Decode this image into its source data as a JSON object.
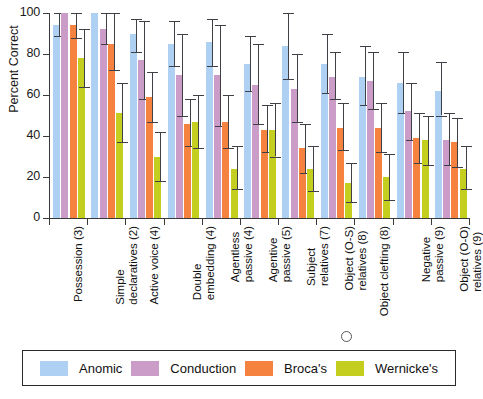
{
  "chart_data": {
    "type": "bar",
    "title": "",
    "xlabel": "",
    "ylabel": "Percent Correct",
    "ylim": [
      0,
      100
    ],
    "yticks": [
      0,
      20,
      40,
      60,
      80,
      100
    ],
    "grid": false,
    "legend_position": "bottom",
    "error_bars": "vertical-range",
    "categories": [
      "Possession (3)",
      "Simple declaratives (2)",
      "Active voice (4)",
      "Double embedding (4)",
      "Agentless passive (4)",
      "Agentive passive (5)",
      "Subject relatives (7)",
      "Object (O-S) relatives (8)",
      "Object clefting (8)",
      "Negative passive (9)",
      "Object (O-O) relatives (9)"
    ],
    "categories_lines": [
      [
        "Possession (3)"
      ],
      [
        "Simple",
        "declaratives (2)"
      ],
      [
        "Active voice (4)"
      ],
      [
        "Double",
        "embedding (4)"
      ],
      [
        "Agentless",
        "passive (4)"
      ],
      [
        "Agentive",
        "passive (5)"
      ],
      [
        "Subject",
        "relatives (7)"
      ],
      [
        "Object (O-S)",
        "relatives (8)"
      ],
      [
        "Object clefting (8)"
      ],
      [
        "Negative",
        "passive (9)"
      ],
      [
        "Object (O-O)",
        "relatives (9)"
      ]
    ],
    "series": [
      {
        "name": "Anomic",
        "color": "#aed0f2",
        "values": [
          94,
          100,
          90,
          85,
          86,
          75,
          84,
          75,
          69,
          66,
          62
        ],
        "err_low": [
          89,
          100,
          81,
          74,
          74,
          62,
          68,
          61,
          55,
          51,
          50
        ],
        "err_high": [
          100,
          100,
          97,
          96,
          97,
          89,
          100,
          90,
          84,
          81,
          76
        ]
      },
      {
        "name": "Conduction",
        "color": "#cc9cc8",
        "values": [
          100,
          92,
          77,
          70,
          70,
          65,
          63,
          69,
          67,
          52,
          38
        ],
        "err_low": [
          100,
          85,
          58,
          50,
          45,
          46,
          47,
          58,
          53,
          38,
          26
        ],
        "err_high": [
          100,
          100,
          96,
          90,
          94,
          85,
          80,
          81,
          81,
          66,
          51
        ]
      },
      {
        "name": "Broca's",
        "color": "#f5833f",
        "values": [
          94,
          85,
          59,
          46,
          47,
          43,
          34,
          44,
          44,
          39,
          37
        ],
        "err_low": [
          88,
          72,
          47,
          35,
          34,
          32,
          22,
          33,
          32,
          27,
          25
        ],
        "err_high": [
          100,
          100,
          71,
          58,
          60,
          55,
          46,
          56,
          56,
          51,
          49
        ]
      },
      {
        "name": "Wernicke's",
        "color": "#c4ce1f",
        "values": [
          78,
          51,
          30,
          47,
          24,
          43,
          24,
          17,
          20,
          38,
          24
        ],
        "err_low": [
          64,
          37,
          18,
          34,
          14,
          30,
          13,
          8,
          9,
          26,
          14
        ],
        "err_high": [
          92,
          66,
          42,
          60,
          35,
          56,
          35,
          27,
          31,
          50,
          35
        ]
      }
    ]
  },
  "axis": {
    "y_label": "Percent Correct",
    "y_ticks": [
      "100",
      "80",
      "60",
      "40",
      "20",
      "0"
    ]
  },
  "legend": {
    "items": [
      {
        "label": "Anomic",
        "color": "#aed0f2"
      },
      {
        "label": "Conduction",
        "color": "#cc9cc8"
      },
      {
        "label": "Broca's",
        "color": "#f5833f"
      },
      {
        "label": "Wernicke's",
        "color": "#c4ce1f"
      }
    ]
  }
}
